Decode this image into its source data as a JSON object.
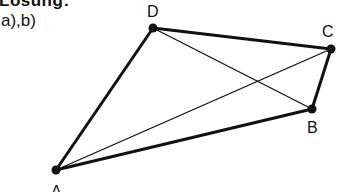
{
  "heading": "Lösung:",
  "subheading": "a),b)",
  "diagram": {
    "points": {
      "A": {
        "label": "A",
        "x": 56,
        "y": 170
      },
      "B": {
        "label": "B",
        "x": 312,
        "y": 109
      },
      "C": {
        "label": "C",
        "x": 331,
        "y": 49
      },
      "D": {
        "label": "D",
        "x": 153,
        "y": 28
      }
    },
    "sides": [
      "AB",
      "BC",
      "CD",
      "DA"
    ],
    "diagonals": [
      "AC",
      "BD"
    ],
    "stroke_color": "#111111"
  }
}
